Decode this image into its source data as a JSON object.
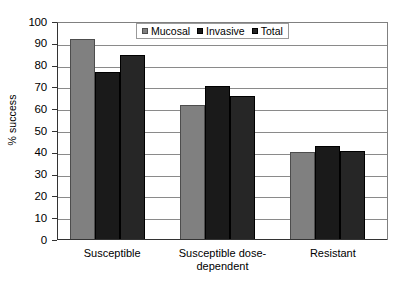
{
  "chart_data": {
    "type": "bar",
    "title": "",
    "subtitle": "",
    "xlabel": "",
    "ylabel": "% success",
    "categories": [
      "Susceptible",
      "Susceptible dose-dependent",
      "Resistant"
    ],
    "series": [
      {
        "name": "Mucosal",
        "color": "#808080",
        "values": [
          92,
          62,
          40.5
        ]
      },
      {
        "name": "Invasive",
        "color": "#1a1a1a",
        "values": [
          77,
          70.5,
          43
        ]
      },
      {
        "name": "Total",
        "color": "#262626",
        "values": [
          85,
          66,
          41
        ]
      }
    ],
    "ylim": [
      0,
      100
    ],
    "ytick_values": [
      0,
      10,
      20,
      30,
      40,
      50,
      60,
      70,
      80,
      90,
      100
    ],
    "ytick_labels": [
      "0",
      "10",
      "20",
      "30",
      "40",
      "50",
      "60",
      "70",
      "80",
      "90",
      "100"
    ],
    "grid": true,
    "grid_axis": "y",
    "legend_position": "top-center",
    "legend_entries": [
      "Mucosal",
      "Invasive",
      "Total"
    ],
    "annotations": []
  },
  "axes": {
    "y_title": "% success"
  },
  "legend": {
    "items": [
      {
        "label": "Mucosal"
      },
      {
        "label": "Invasive"
      },
      {
        "label": "Total"
      }
    ]
  },
  "x_categories": [
    {
      "line1": "Susceptible",
      "line2": ""
    },
    {
      "line1": "Susceptible dose-",
      "line2": "dependent"
    },
    {
      "line1": "Resistant",
      "line2": ""
    }
  ],
  "y_labels": [
    "100",
    "90",
    "80",
    "70",
    "60",
    "50",
    "40",
    "30",
    "20",
    "10",
    "0"
  ]
}
